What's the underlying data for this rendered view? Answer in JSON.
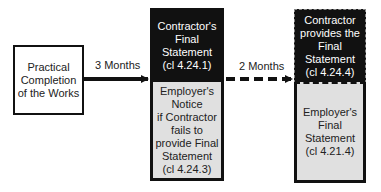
{
  "diagram": {
    "start_box": {
      "text": "Practical\nCompletion\nof the Works"
    },
    "arrow1": {
      "label": "3 Months",
      "style": "solid"
    },
    "contractor_final_statement": {
      "text": "Contractor's\nFinal\nStatement\n(cl 4.24.1)"
    },
    "employer_notice": {
      "text": "Employer's\nNotice\nif Contractor\nfails to\nprovide Final\nStatement\n(cl 4.24.3)"
    },
    "arrow2": {
      "label": "2 Months",
      "style": "dashed"
    },
    "contractor_provides": {
      "text": "Contractor\nprovides the\nFinal\nStatement\n(cl 4.24.4)"
    },
    "employer_final_statement": {
      "text": "Employer's\nFinal\nStatement\n(cl 4.21.4)"
    }
  },
  "colors": {
    "dark": "#111111",
    "light_fill": "#e0e0e0",
    "line": "#111111"
  }
}
